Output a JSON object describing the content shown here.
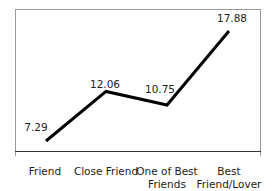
{
  "chart_data": {
    "type": "line",
    "title": "",
    "xlabel": "",
    "ylabel": "",
    "categories": [
      "Friend",
      "Close Friend",
      "One of Best Friends",
      "Best Friend/Lover"
    ],
    "category_lines": [
      [
        "Friend"
      ],
      [
        "Close Friend"
      ],
      [
        "One of Best",
        "Friends"
      ],
      [
        "Best",
        "Friend/Lover"
      ]
    ],
    "series": [
      {
        "name": "",
        "values": [
          7.29,
          12.06,
          10.75,
          17.88
        ],
        "color": "#000000"
      }
    ],
    "data_labels": [
      "7.29",
      "12.06",
      "10.75",
      "17.88"
    ],
    "grid": false,
    "legend": null,
    "axis_visible": false
  }
}
